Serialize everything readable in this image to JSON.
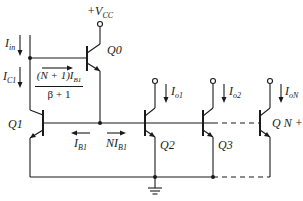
{
  "diagram": {
    "type": "circuit-schematic",
    "supply": {
      "label": "+V",
      "sub": "CC"
    },
    "currents": {
      "input": {
        "label": "I",
        "sub": "in"
      },
      "collector_q1": {
        "label": "I",
        "sub": "C1"
      },
      "helper_numerator": "(N + 1)I",
      "helper_numerator_sub": "B1",
      "helper_denominator": "β + 1",
      "base_q1": {
        "label": "I",
        "sub": "B1"
      },
      "base_outputs": {
        "label": "NI",
        "sub": "B1"
      },
      "out1": {
        "label": "I",
        "sub": "o1"
      },
      "out2": {
        "label": "I",
        "sub": "o2"
      },
      "outN": {
        "label": "I",
        "sub": "oN"
      }
    },
    "transistors": [
      {
        "id": "Q0",
        "label": "Q0"
      },
      {
        "id": "Q1",
        "label": "Q1"
      },
      {
        "id": "Q2",
        "label": "Q2"
      },
      {
        "id": "Q3",
        "label": "Q3"
      },
      {
        "id": "QN1",
        "label": "Q N + 1"
      }
    ],
    "colors": {
      "line": "#1a1a1a",
      "background": "#ffffff"
    }
  }
}
